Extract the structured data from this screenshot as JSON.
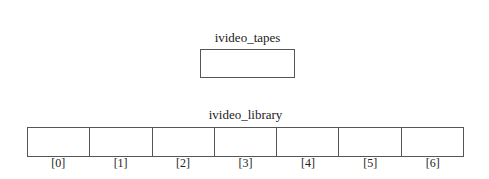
{
  "diagram": {
    "pointer": {
      "name": "ivideo_tapes"
    },
    "array": {
      "name": "ivideo_library",
      "length": 7,
      "indices": [
        "[0]",
        "[1]",
        "[2]",
        "[3]",
        "[4]",
        "[5]",
        "[6]"
      ]
    }
  }
}
